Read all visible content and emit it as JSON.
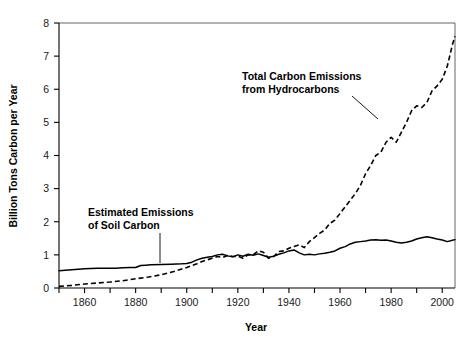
{
  "chart_data": {
    "type": "line",
    "title": "",
    "xlabel": "Year",
    "ylabel": "Billion Tons Carbon per Year",
    "xlim": [
      1850,
      2005
    ],
    "ylim": [
      0,
      8
    ],
    "grid": false,
    "legend_position": "inline-annotations",
    "x_ticks_major": [
      1860,
      1880,
      1900,
      1920,
      1940,
      1960,
      1980,
      2000
    ],
    "x_tick_labels": [
      "1860",
      "1880",
      "1900",
      "1920",
      "1940",
      "1960",
      "1980",
      "2000"
    ],
    "x_ticks_minor": [
      1850,
      1870,
      1890,
      1910,
      1930,
      1950,
      1970,
      1990,
      2000
    ],
    "y_ticks": [
      0,
      1,
      2,
      3,
      4,
      5,
      6,
      7,
      8
    ],
    "y_tick_labels": [
      "0",
      "1",
      "2",
      "3",
      "4",
      "5",
      "6",
      "7",
      "8"
    ],
    "series": [
      {
        "name": "Estimated Emissions of Soil Carbon",
        "style": "solid",
        "color": "#000000",
        "x": [
          1850,
          1855,
          1860,
          1865,
          1868,
          1870,
          1872,
          1875,
          1878,
          1880,
          1882,
          1884,
          1886,
          1890,
          1894,
          1898,
          1900,
          1902,
          1904,
          1906,
          1908,
          1910,
          1912,
          1914,
          1916,
          1918,
          1920,
          1922,
          1924,
          1926,
          1928,
          1930,
          1932,
          1934,
          1936,
          1938,
          1940,
          1942,
          1944,
          1946,
          1948,
          1950,
          1952,
          1954,
          1956,
          1958,
          1960,
          1962,
          1964,
          1966,
          1968,
          1970,
          1972,
          1974,
          1976,
          1978,
          1980,
          1982,
          1984,
          1986,
          1988,
          1990,
          1992,
          1994,
          1996,
          1998,
          2000,
          2002,
          2004,
          2005
        ],
        "y": [
          0.52,
          0.55,
          0.58,
          0.6,
          0.6,
          0.6,
          0.6,
          0.61,
          0.62,
          0.62,
          0.68,
          0.69,
          0.7,
          0.71,
          0.72,
          0.73,
          0.74,
          0.78,
          0.85,
          0.9,
          0.93,
          0.95,
          1.0,
          1.02,
          0.97,
          0.94,
          1.0,
          0.96,
          1.02,
          0.99,
          1.03,
          0.98,
          0.93,
          0.96,
          1.02,
          1.06,
          1.12,
          1.15,
          1.06,
          1.0,
          1.02,
          1.0,
          1.03,
          1.05,
          1.08,
          1.12,
          1.2,
          1.25,
          1.33,
          1.38,
          1.4,
          1.42,
          1.45,
          1.46,
          1.44,
          1.45,
          1.42,
          1.38,
          1.36,
          1.38,
          1.42,
          1.48,
          1.52,
          1.55,
          1.52,
          1.48,
          1.45,
          1.4,
          1.44,
          1.46
        ]
      },
      {
        "name": "Total Carbon Emissions from Hydrocarbons",
        "style": "dashed",
        "color": "#000000",
        "x": [
          1850,
          1855,
          1860,
          1865,
          1870,
          1875,
          1880,
          1885,
          1890,
          1895,
          1900,
          1902,
          1904,
          1906,
          1908,
          1910,
          1912,
          1914,
          1916,
          1918,
          1920,
          1922,
          1924,
          1926,
          1928,
          1930,
          1932,
          1934,
          1936,
          1938,
          1940,
          1942,
          1944,
          1946,
          1948,
          1950,
          1952,
          1954,
          1956,
          1958,
          1960,
          1962,
          1964,
          1966,
          1968,
          1970,
          1972,
          1974,
          1976,
          1978,
          1980,
          1982,
          1984,
          1986,
          1988,
          1990,
          1992,
          1994,
          1996,
          1998,
          2000,
          2002,
          2004,
          2005
        ],
        "y": [
          0.05,
          0.08,
          0.12,
          0.15,
          0.18,
          0.22,
          0.28,
          0.33,
          0.4,
          0.5,
          0.62,
          0.68,
          0.73,
          0.8,
          0.85,
          0.9,
          0.95,
          0.92,
          0.98,
          0.95,
          0.96,
          0.9,
          1.0,
          1.0,
          1.12,
          1.08,
          0.9,
          0.95,
          1.1,
          1.12,
          1.2,
          1.25,
          1.3,
          1.22,
          1.4,
          1.52,
          1.65,
          1.75,
          1.95,
          2.05,
          2.25,
          2.45,
          2.65,
          2.85,
          3.1,
          3.45,
          3.7,
          4.0,
          4.1,
          4.4,
          4.55,
          4.4,
          4.7,
          5.0,
          5.35,
          5.5,
          5.45,
          5.6,
          5.95,
          6.1,
          6.3,
          6.7,
          7.35,
          7.6
        ]
      }
    ],
    "annotations": [
      {
        "name": "hydrocarbons-annotation",
        "text_line1": "Total Carbon Emissions",
        "text_line2": "from Hydrocarbons",
        "text_x": 242,
        "text_y": 80,
        "leader": {
          "x1": 352,
          "y1": 96,
          "x2": 378,
          "y2": 119
        }
      },
      {
        "name": "soil-carbon-annotation",
        "text_line1": "Estimated Emissions",
        "text_line2": "of Soil Carbon",
        "text_x": 88,
        "text_y": 216,
        "leader": {
          "x1": 160,
          "y1": 233,
          "x2": 160,
          "y2": 263
        }
      }
    ]
  }
}
